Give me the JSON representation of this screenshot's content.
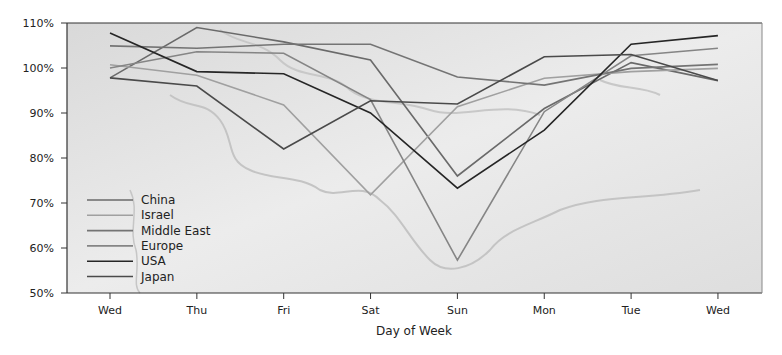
{
  "chart_data": {
    "type": "line",
    "title": "",
    "xlabel": "Day of Week",
    "ylabel": "",
    "categories": [
      "Wed",
      "Thu",
      "Fri",
      "Sat",
      "Sun",
      "Mon",
      "Tue",
      "Wed"
    ],
    "ylim": [
      50,
      110
    ],
    "yticks": [
      "50%",
      "60%",
      "70%",
      "80%",
      "90%",
      "100%",
      "110%"
    ],
    "ytick_values": [
      50,
      60,
      70,
      80,
      90,
      100,
      110
    ],
    "grid": false,
    "background": "grayscale world map (Europe / Middle East / Asia)",
    "legend_position": "lower-left inside plot",
    "series": [
      {
        "name": "China",
        "color": "#6a6a6a",
        "values": [
          97.8,
          109.0,
          105.8,
          101.8,
          76.0,
          91.0,
          101.2,
          97.2
        ]
      },
      {
        "name": "Israel",
        "color": "#a0a0a0",
        "values": [
          100.7,
          98.4,
          91.8,
          71.8,
          91.4,
          97.7,
          99.2,
          99.9
        ]
      },
      {
        "name": "Middle East",
        "color": "#747474",
        "values": [
          104.9,
          104.4,
          105.3,
          105.3,
          98.0,
          96.2,
          99.9,
          100.8
        ]
      },
      {
        "name": "Europe",
        "color": "#858585",
        "values": [
          100.0,
          103.6,
          103.3,
          93.0,
          57.3,
          90.3,
          102.7,
          104.4
        ]
      },
      {
        "name": "USA",
        "color": "#262626",
        "values": [
          107.8,
          99.2,
          98.7,
          90.0,
          73.3,
          86.2,
          105.3,
          107.2
        ]
      },
      {
        "name": "Japan",
        "color": "#4a4a4a",
        "values": [
          97.8,
          96.0,
          82.0,
          92.7,
          92.0,
          102.5,
          103.0,
          97.2
        ]
      }
    ]
  }
}
